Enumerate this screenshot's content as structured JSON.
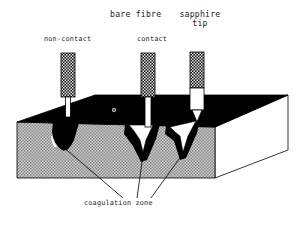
{
  "figure": {
    "title_labels": {
      "bare_fibre": "bare fibre",
      "sapphire_tip": "sapphire\ntip"
    },
    "mode_labels": {
      "non_contact": "non-contact",
      "contact": "contact"
    },
    "caption": "coagulation zone"
  },
  "colors": {
    "background": "#ffffff",
    "tissue_surface": "#000000",
    "tissue_body": "#b4b4b4",
    "tissue_side": "#ffffff",
    "coagulation_zone": "#000000",
    "vaporization_channel": "#ffffff",
    "fiber_cable": "#2a2a2a",
    "fiber_tube": "#ffffff",
    "outline": "#000000",
    "text": "#1a1a1a"
  },
  "elements": {
    "probes": [
      {
        "name": "non-contact-fibre",
        "label": "non-contact",
        "type": "bare fibre",
        "contact": false
      },
      {
        "name": "contact-fibre",
        "label": "contact",
        "type": "bare fibre",
        "contact": true
      },
      {
        "name": "sapphire-tip-probe",
        "label": "sapphire tip",
        "type": "sapphire tip",
        "contact": true
      }
    ],
    "zones": [
      {
        "name": "coagulation-zone-non-contact",
        "shape": "teardrop"
      },
      {
        "name": "coagulation-zone-contact",
        "shape": "v-crater"
      },
      {
        "name": "coagulation-zone-sapphire",
        "shape": "v-crater"
      }
    ],
    "surface_marker": "small-circle-marker",
    "leader_lines": 3
  }
}
